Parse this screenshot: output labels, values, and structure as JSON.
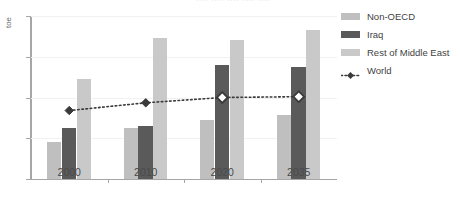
{
  "chart": {
    "title_clipped": "....  ....  ....  ....  ....",
    "ylabel": "toe"
  },
  "legend": {
    "position": "right",
    "items": [
      {
        "label": "Non-OECD",
        "type": "bar",
        "color": "#bfbfbf"
      },
      {
        "label": "Iraq",
        "type": "bar",
        "color": "#5a5a5a"
      },
      {
        "label": "Rest of Middle East",
        "type": "bar",
        "color": "#c9c9c9"
      },
      {
        "label": "World",
        "type": "line",
        "color": "#3a3a3a"
      }
    ]
  },
  "chart_data": {
    "type": "bar",
    "title": "",
    "xlabel": "",
    "ylabel": "toe",
    "ylim": [
      0,
      4
    ],
    "yticks": [
      0,
      1,
      2,
      3,
      4
    ],
    "ytick_labels": [
      "0",
      "1",
      "2",
      "3",
      "4"
    ],
    "grid": true,
    "legend_position": "right",
    "categories": [
      "2000",
      "2010",
      "2020",
      "2035"
    ],
    "series": [
      {
        "name": "Non-OECD",
        "type": "bar",
        "color": "#bfbfbf",
        "values": [
          0.9,
          1.25,
          1.45,
          1.58
        ]
      },
      {
        "name": "Iraq",
        "type": "bar",
        "color": "#5a5a5a",
        "values": [
          1.25,
          1.3,
          2.8,
          2.75
        ]
      },
      {
        "name": "Rest of Middle East",
        "type": "bar",
        "color": "#c9c9c9",
        "values": [
          2.45,
          3.45,
          3.4,
          3.65
        ]
      },
      {
        "name": "World",
        "type": "line",
        "color": "#3a3a3a",
        "linestyle": "dotted",
        "marker": "diamond",
        "values": [
          1.68,
          1.87,
          2.0,
          2.02
        ],
        "marker_filled": [
          true,
          true,
          false,
          false
        ]
      }
    ]
  }
}
